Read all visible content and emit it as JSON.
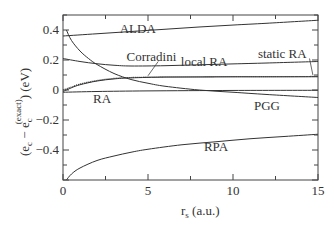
{
  "chart_data": {
    "type": "line",
    "title": "",
    "xlabel": "r_s (a.u.)",
    "xlabel_main": "r",
    "xlabel_sub": "s",
    "xlabel_unit": " (a.u.)",
    "ylabel": "(e_c - e_c^(exact)) (eV)",
    "ylabel_parts": {
      "open": "(e",
      "sub1": "c",
      "minus": " − e",
      "sub2": "c",
      "sup2": "(exact)",
      "close": ") (eV)"
    },
    "xlim": [
      0,
      15
    ],
    "ylim": [
      -0.6,
      0.5
    ],
    "grid": false,
    "legend": "inline labels",
    "x_ticks": [
      0,
      5,
      10,
      15
    ],
    "x_tick_labels": [
      "0",
      "5",
      "10",
      "15"
    ],
    "y_ticks": [
      0.4,
      0.2,
      0,
      -0.2,
      -0.4
    ],
    "y_tick_labels": [
      "0.4",
      "0.2",
      "0",
      "-0.2",
      "-0.4"
    ],
    "series": [
      {
        "name": "ALDA",
        "style": "solid",
        "x": [
          0,
          2,
          4,
          6,
          8,
          10,
          12,
          15
        ],
        "y": [
          0.36,
          0.375,
          0.39,
          0.405,
          0.42,
          0.433,
          0.445,
          0.465
        ]
      },
      {
        "name": "local RA",
        "style": "solid",
        "x": [
          0,
          1,
          2,
          3,
          4,
          6,
          8,
          10,
          12,
          15
        ],
        "y": [
          0.21,
          0.19,
          0.175,
          0.165,
          0.16,
          0.162,
          0.168,
          0.174,
          0.18,
          0.19
        ]
      },
      {
        "name": "Corradini",
        "style": "dotted",
        "x": [
          0,
          0.5,
          1,
          2,
          3,
          4,
          6,
          8,
          10,
          12,
          15
        ],
        "y": [
          0.0,
          0.02,
          0.04,
          0.063,
          0.077,
          0.083,
          0.087,
          0.088,
          0.089,
          0.089,
          0.09
        ]
      },
      {
        "name": "static RA",
        "style": "solid",
        "x": [
          0,
          0.5,
          1,
          2,
          3,
          4,
          6,
          8,
          10,
          12,
          15
        ],
        "y": [
          -0.01,
          0.015,
          0.035,
          0.06,
          0.074,
          0.081,
          0.086,
          0.087,
          0.088,
          0.088,
          0.089
        ]
      },
      {
        "name": "PGG",
        "style": "solid",
        "x": [
          0.2,
          0.5,
          1,
          1.5,
          2,
          3,
          4,
          5,
          6,
          8,
          10,
          12,
          15
        ],
        "y": [
          0.4,
          0.33,
          0.26,
          0.21,
          0.17,
          0.11,
          0.07,
          0.045,
          0.025,
          0.0,
          -0.015,
          -0.03,
          -0.05
        ]
      },
      {
        "name": "RA",
        "style": "solid",
        "x": [
          0,
          2,
          5,
          10,
          15
        ],
        "y": [
          -0.015,
          -0.01,
          -0.006,
          -0.003,
          -0.002
        ]
      },
      {
        "name": "RPA",
        "style": "solid",
        "x": [
          0.2,
          0.5,
          1,
          2,
          3,
          4,
          5,
          7,
          9,
          11,
          13,
          15
        ],
        "y": [
          -0.6,
          -0.56,
          -0.52,
          -0.47,
          -0.44,
          -0.415,
          -0.395,
          -0.365,
          -0.345,
          -0.325,
          -0.31,
          -0.295
        ]
      }
    ],
    "annotations": [
      {
        "text": "ALDA",
        "x": 4.4,
        "y": 0.41
      },
      {
        "text": "Corradini",
        "x": 5.2,
        "y": 0.22
      },
      {
        "text": "local RA",
        "x": 8.3,
        "y": 0.19
      },
      {
        "text": "static RA",
        "x": 12.9,
        "y": 0.24
      },
      {
        "text": "RA",
        "x": 2.3,
        "y": -0.06
      },
      {
        "text": "PGG",
        "x": 12.0,
        "y": -0.105
      },
      {
        "text": "RPA",
        "x": 9.0,
        "y": -0.38
      }
    ]
  }
}
